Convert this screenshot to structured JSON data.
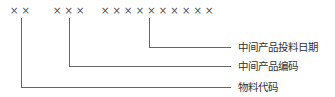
{
  "code_groups": [
    {
      "name": "material-code",
      "symbols": "× ×"
    },
    {
      "name": "intermediate-product-code",
      "symbols": "× × ×"
    },
    {
      "name": "intermediate-product-input-date",
      "symbols": "× × × × × × × × × ×"
    }
  ],
  "labels": {
    "input_date": "中间产品投料日期",
    "product_code": "中间产品编码",
    "material_code": "物料代码"
  },
  "colors": {
    "line": "#666666",
    "text": "#333333"
  }
}
